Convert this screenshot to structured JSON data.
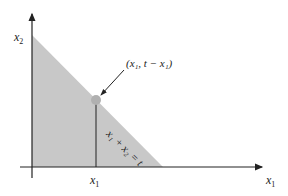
{
  "diagram": {
    "type": "feasible-region",
    "y_axis_label": {
      "var": "x",
      "sub": "2"
    },
    "x_axis_label": {
      "var": "x",
      "sub": "1"
    },
    "tick_label": {
      "var": "x",
      "sub": "1"
    },
    "point_label": "(x₁, t − x₁)",
    "line_label": "x₁ + x₂ = t",
    "colors": {
      "region": "#c8c8c8",
      "point": "#b0b0b0",
      "axis": "#222222"
    }
  }
}
